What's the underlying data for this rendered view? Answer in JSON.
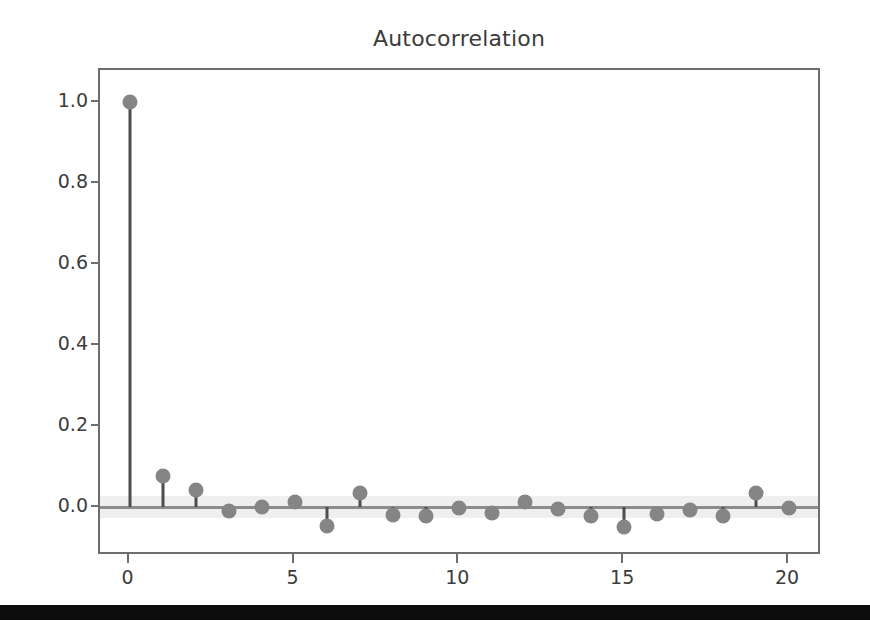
{
  "figure": {
    "title": "Autocorrelation",
    "background_color": "#ffffff",
    "axes_color": "#6e6e6e",
    "marker_color": "#858585",
    "stem_color": "#4d4d4d",
    "confidence_band_color": "#efefef",
    "zero_line_color": "#8c8c8c",
    "footer_bar_color": "#0c0c0c"
  },
  "chart_data": {
    "type": "line",
    "plot_style": "stem",
    "title": "Autocorrelation",
    "xlabel": "",
    "ylabel": "",
    "xlim": [
      -0.9,
      21.0
    ],
    "ylim": [
      -0.12,
      1.08
    ],
    "xticks": [
      0,
      5,
      10,
      15,
      20
    ],
    "xtick_labels": [
      "0",
      "5",
      "10",
      "15",
      "20"
    ],
    "yticks": [
      0.0,
      0.2,
      0.4,
      0.6,
      0.8,
      1.0
    ],
    "ytick_labels": [
      "0.0",
      "0.2",
      "0.4",
      "0.6",
      "0.8",
      "1.0"
    ],
    "grid": false,
    "legend": null,
    "zero_line": 0.0,
    "confidence_interval": [
      -0.027,
      0.027
    ],
    "x": [
      0,
      1,
      2,
      3,
      4,
      5,
      6,
      7,
      8,
      9,
      10,
      11,
      12,
      13,
      14,
      15,
      16,
      17,
      18,
      19,
      20
    ],
    "values": [
      1.0,
      0.078,
      0.043,
      -0.008,
      0.002,
      0.013,
      -0.046,
      0.035,
      -0.018,
      -0.02,
      -0.002,
      -0.014,
      0.014,
      -0.003,
      -0.022,
      -0.048,
      -0.017,
      -0.007,
      -0.021,
      0.035,
      -0.002
    ],
    "series": [
      {
        "name": "ACF",
        "values": [
          1.0,
          0.078,
          0.043,
          -0.008,
          0.002,
          0.013,
          -0.046,
          0.035,
          -0.018,
          -0.02,
          -0.002,
          -0.014,
          0.014,
          -0.003,
          -0.022,
          -0.048,
          -0.017,
          -0.007,
          -0.021,
          0.035,
          -0.002
        ]
      }
    ]
  }
}
